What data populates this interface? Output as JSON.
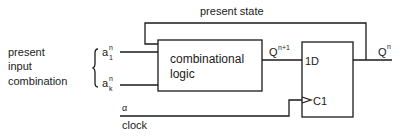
{
  "diagram": {
    "title_feedback": "present state",
    "left_label": [
      "present",
      "input",
      "combination"
    ],
    "inputs": [
      {
        "base": "a",
        "sup": "n",
        "sub": "1"
      },
      {
        "base": "a",
        "sup": "n",
        "sub": "k"
      }
    ],
    "combinational_block": {
      "line1": "combinational",
      "line2": "logic"
    },
    "next_state": {
      "base": "Q",
      "sup": "n+1"
    },
    "flipflop": {
      "d_input": "1D",
      "clock_input": "C1"
    },
    "output": {
      "base": "Q",
      "sup": "n"
    },
    "clock_signal": {
      "symbol": "α",
      "label": "clock"
    }
  }
}
